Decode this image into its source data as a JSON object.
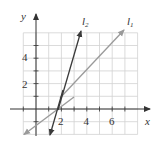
{
  "axes": {
    "x_label": "x",
    "y_label": "y",
    "x_ticks": [
      "2",
      "4",
      "6"
    ],
    "y_ticks": [
      "2",
      "4"
    ],
    "x_range": [
      -1,
      7
    ],
    "y_range": [
      -2,
      6
    ]
  },
  "lines": [
    {
      "name": "l1",
      "label": "l",
      "subscript": "1",
      "equation": "y = x - 1",
      "color": "#9a9a9a"
    },
    {
      "name": "l2",
      "label": "l",
      "subscript": "2",
      "equation": "y = 3x - 5",
      "color": "#3a3a3a"
    }
  ],
  "colors": {
    "grid": "#cfcfcf",
    "axis": "#333333"
  }
}
